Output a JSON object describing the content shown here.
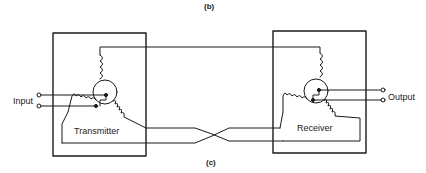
{
  "figure": {
    "top_caption": "(b)",
    "bottom_caption": "(c)"
  },
  "transmitter": {
    "label": "Transmitter",
    "terminal_label": "Input"
  },
  "receiver": {
    "label": "Receiver",
    "terminal_label": "Output"
  },
  "colors": {
    "line": "#1a1a1a",
    "background": "#ffffff"
  }
}
